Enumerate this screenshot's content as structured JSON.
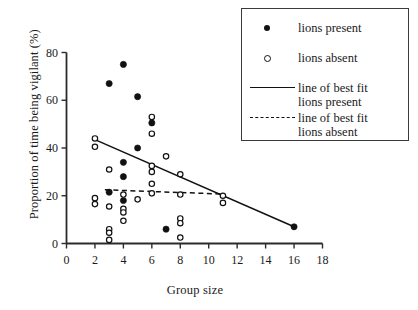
{
  "chart_data": {
    "type": "scatter",
    "title": "",
    "xlabel": "Group size",
    "ylabel": "Proportion of time being vigilant (%)",
    "xlim": [
      0,
      18
    ],
    "ylim": [
      0,
      80
    ],
    "xticks": [
      0,
      2,
      4,
      6,
      8,
      10,
      12,
      14,
      16,
      18
    ],
    "yticks": [
      0,
      20,
      40,
      60,
      80
    ],
    "xtick_labels": [
      "0",
      "2",
      "4",
      "6",
      "8",
      "10",
      "12",
      "14",
      "16",
      "18"
    ],
    "ytick_labels": [
      "0",
      "20",
      "40",
      "60",
      "80"
    ],
    "grid": false,
    "legend_position": "top-right",
    "series": [
      {
        "name": "lions present",
        "marker": "filled-circle",
        "color": "#111111",
        "points": [
          {
            "x": 3,
            "y": 67
          },
          {
            "x": 4,
            "y": 75
          },
          {
            "x": 5,
            "y": 61.5
          },
          {
            "x": 6,
            "y": 50.5
          },
          {
            "x": 5,
            "y": 40
          },
          {
            "x": 4,
            "y": 34
          },
          {
            "x": 4,
            "y": 28
          },
          {
            "x": 3,
            "y": 21.5
          },
          {
            "x": 4,
            "y": 18
          },
          {
            "x": 7,
            "y": 6
          },
          {
            "x": 16,
            "y": 7
          }
        ]
      },
      {
        "name": "lions absent",
        "marker": "open-circle",
        "color": "#111111",
        "points": [
          {
            "x": 2,
            "y": 44
          },
          {
            "x": 2,
            "y": 40.5
          },
          {
            "x": 3,
            "y": 31
          },
          {
            "x": 6,
            "y": 53
          },
          {
            "x": 6,
            "y": 46
          },
          {
            "x": 6,
            "y": 32.5
          },
          {
            "x": 6,
            "y": 30
          },
          {
            "x": 6,
            "y": 25
          },
          {
            "x": 7,
            "y": 36.5
          },
          {
            "x": 8,
            "y": 29
          },
          {
            "x": 2,
            "y": 19
          },
          {
            "x": 2,
            "y": 16.5
          },
          {
            "x": 3,
            "y": 15.5
          },
          {
            "x": 4,
            "y": 20.5
          },
          {
            "x": 4,
            "y": 14.5
          },
          {
            "x": 4,
            "y": 13
          },
          {
            "x": 4,
            "y": 9.5
          },
          {
            "x": 5,
            "y": 18.5
          },
          {
            "x": 6,
            "y": 21
          },
          {
            "x": 8,
            "y": 20.5
          },
          {
            "x": 8,
            "y": 10.5
          },
          {
            "x": 8,
            "y": 8.5
          },
          {
            "x": 8,
            "y": 2.5
          },
          {
            "x": 3,
            "y": 6
          },
          {
            "x": 3,
            "y": 4.5
          },
          {
            "x": 3,
            "y": 1.5
          },
          {
            "x": 11,
            "y": 20
          },
          {
            "x": 11,
            "y": 17
          }
        ]
      }
    ],
    "fit_lines": [
      {
        "name": "line of best fit lions present",
        "style": "solid",
        "color": "#111111",
        "x1": 2,
        "y1": 43.5,
        "x2": 16,
        "y2": 7
      },
      {
        "name": "line of best fit lions absent",
        "style": "dashed",
        "color": "#111111",
        "x1": 2.7,
        "y1": 22.5,
        "x2": 11,
        "y2": 20.7
      }
    ]
  },
  "legend": {
    "entries": [
      {
        "key": "filled-circle",
        "label": "lions present",
        "label2": ""
      },
      {
        "key": "open-circle",
        "label": "lions absent",
        "label2": ""
      },
      {
        "key": "solid-line",
        "label": "line of best fit",
        "label2": "lions present"
      },
      {
        "key": "dashed-line",
        "label": "line of best fit",
        "label2": "lions absent"
      }
    ]
  }
}
